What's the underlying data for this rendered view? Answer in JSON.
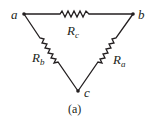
{
  "diagram": {
    "type": "delta-resistor-network",
    "nodes": [
      {
        "id": "a",
        "label": "a"
      },
      {
        "id": "b",
        "label": "b"
      },
      {
        "id": "c",
        "label": "c"
      }
    ],
    "resistors": [
      {
        "id": "Rc",
        "symbol": "R",
        "subscript": "c",
        "between": [
          "a",
          "b"
        ]
      },
      {
        "id": "Rb",
        "symbol": "R",
        "subscript": "b",
        "between": [
          "a",
          "c"
        ]
      },
      {
        "id": "Ra",
        "symbol": "R",
        "subscript": "a",
        "between": [
          "b",
          "c"
        ]
      }
    ],
    "caption": "(a)",
    "colors": {
      "ink": "#231f20",
      "background": "#ffffff"
    }
  }
}
